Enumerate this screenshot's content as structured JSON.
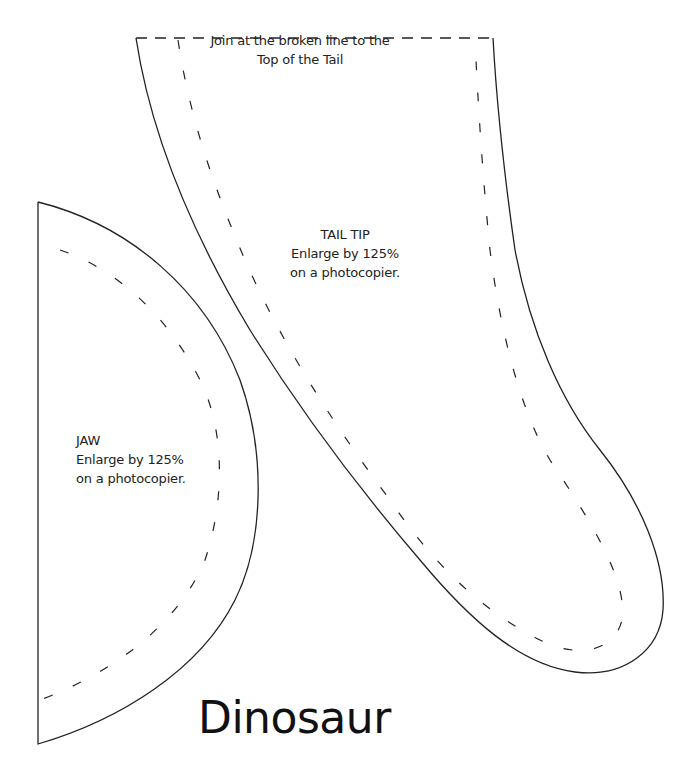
{
  "document": {
    "title": "Dinosaur"
  },
  "pieces": {
    "tail_tip": {
      "join_note_line1": "Join at the broken line to the",
      "join_note_line2": "Top of the Tail",
      "name": "TAIL TIP",
      "instruction_line1": "Enlarge by 125%",
      "instruction_line2": "on a photocopier."
    },
    "jaw": {
      "name": "JAW",
      "instruction_line1": "Enlarge by 125%",
      "instruction_line2": "on a photocopier."
    }
  },
  "colors": {
    "line": "#222222",
    "background": "#ffffff"
  }
}
